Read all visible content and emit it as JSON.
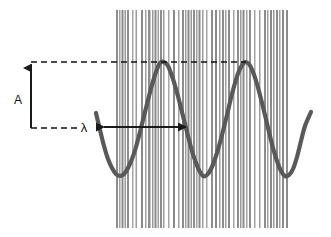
{
  "figure": {
    "background_color": "#ffffff",
    "width": 331,
    "height": 237
  },
  "labels": {
    "amplitude": "A",
    "wavelength": "λ"
  },
  "annotations": {
    "amplitude_arrow": {
      "name": "amplitude-arrow",
      "orientation": "vertical",
      "x": 31,
      "y_bottom": 128,
      "y_top": 62,
      "arrowhead": "top",
      "color": "#1a1a1a"
    },
    "wavelength_arrow": {
      "name": "wavelength-arrow",
      "orientation": "horizontal",
      "y": 127,
      "x_left": 101,
      "x_right": 189,
      "arrowhead": "both",
      "color": "#1a1a1a"
    },
    "dashed_line_crest": {
      "name": "crest-guide-line",
      "y": 62,
      "x_start": 31,
      "x_end": 246,
      "color": "#111111"
    },
    "dashed_line_midline": {
      "name": "midline-guide-line",
      "y": 128,
      "x_start": 31,
      "x_end": 78,
      "color": "#111111"
    }
  },
  "chart_data": {
    "type": "line",
    "title": "",
    "subtitle": "",
    "xlabel": "",
    "ylabel": "",
    "grid": false,
    "legend": null,
    "axis_ranges": {
      "x": [
        96,
        311
      ],
      "y": [
        62,
        177
      ]
    },
    "annotations": [
      {
        "text": "A",
        "meaning": "amplitude",
        "x": 18,
        "y": 100
      },
      {
        "text": "λ",
        "meaning": "wavelength",
        "x": 84,
        "y": 128
      }
    ],
    "series": [
      {
        "name": "wave",
        "color": "#595959",
        "line_width": 4.2,
        "wave_params": {
          "amplitude_px": 57,
          "midline_y": 119,
          "crest_y": 62,
          "trough_y": 176,
          "wavelength_px": 88,
          "x_start": 96,
          "x_end": 311,
          "first_trough_x": 120,
          "first_crest_x": 160,
          "second_trough_x": 203,
          "second_crest_x": 245,
          "third_trough_x": 287
        },
        "points": [
          [
            96,
            113
          ],
          [
            100,
            130
          ],
          [
            104,
            146
          ],
          [
            108,
            159
          ],
          [
            112,
            168
          ],
          [
            116,
            174
          ],
          [
            120,
            176
          ],
          [
            124,
            174
          ],
          [
            128,
            168
          ],
          [
            132,
            159
          ],
          [
            136,
            147
          ],
          [
            140,
            132
          ],
          [
            144,
            116
          ],
          [
            148,
            100
          ],
          [
            152,
            85
          ],
          [
            156,
            72
          ],
          [
            160,
            63
          ],
          [
            164,
            62
          ],
          [
            168,
            66
          ],
          [
            172,
            76
          ],
          [
            176,
            89
          ],
          [
            180,
            104
          ],
          [
            184,
            120
          ],
          [
            188,
            136
          ],
          [
            192,
            151
          ],
          [
            196,
            163
          ],
          [
            200,
            172
          ],
          [
            203,
            176
          ],
          [
            207,
            175
          ],
          [
            211,
            169
          ],
          [
            215,
            159
          ],
          [
            219,
            146
          ],
          [
            223,
            131
          ],
          [
            227,
            115
          ],
          [
            231,
            98
          ],
          [
            235,
            83
          ],
          [
            239,
            71
          ],
          [
            243,
            64
          ],
          [
            245,
            62
          ],
          [
            249,
            64
          ],
          [
            253,
            72
          ],
          [
            257,
            84
          ],
          [
            261,
            99
          ],
          [
            265,
            115
          ],
          [
            269,
            132
          ],
          [
            273,
            148
          ],
          [
            277,
            161
          ],
          [
            281,
            171
          ],
          [
            285,
            176
          ],
          [
            289,
            175
          ],
          [
            293,
            169
          ],
          [
            297,
            157
          ],
          [
            301,
            141
          ],
          [
            305,
            126
          ],
          [
            311,
            112
          ]
        ]
      }
    ]
  },
  "barcode": {
    "name": "barcode-background",
    "x": 116,
    "y": 10,
    "width": 174,
    "height": 218,
    "bar_color_dark": "#8a8a8a",
    "bar_color_light": "#b4b4b4",
    "bars": [
      {
        "x": 0,
        "w": 2,
        "c": "#8d8d8d"
      },
      {
        "x": 3,
        "w": 1.5,
        "c": "#a0a0a0"
      },
      {
        "x": 5.5,
        "w": 2,
        "c": "#8a8a8a"
      },
      {
        "x": 8.5,
        "w": 1.5,
        "c": "#9a9a9a"
      },
      {
        "x": 11,
        "w": 2,
        "c": "#8d8d8d"
      },
      {
        "x": 16,
        "w": 1.5,
        "c": "#a5a5a5"
      },
      {
        "x": 19.5,
        "w": 1.5,
        "c": "#9a9a9a"
      },
      {
        "x": 25,
        "w": 2,
        "c": "#8a8a8a"
      },
      {
        "x": 29,
        "w": 1.5,
        "c": "#a0a0a0"
      },
      {
        "x": 32,
        "w": 2.5,
        "c": "#8d8d8d"
      },
      {
        "x": 36,
        "w": 1.5,
        "c": "#999999"
      },
      {
        "x": 38.5,
        "w": 2,
        "c": "#8a8a8a"
      },
      {
        "x": 41.5,
        "w": 1.5,
        "c": "#a2a2a2"
      },
      {
        "x": 44,
        "w": 2,
        "c": "#8d8d8d"
      },
      {
        "x": 47,
        "w": 1.5,
        "c": "#9c9c9c"
      },
      {
        "x": 52,
        "w": 1.5,
        "c": "#a5a5a5"
      },
      {
        "x": 57,
        "w": 2,
        "c": "#8a8a8a"
      },
      {
        "x": 62,
        "w": 1.5,
        "c": "#9f9f9f"
      },
      {
        "x": 66,
        "w": 2,
        "c": "#8d8d8d"
      },
      {
        "x": 69,
        "w": 1.5,
        "c": "#a0a0a0"
      },
      {
        "x": 71.5,
        "w": 2,
        "c": "#8a8a8a"
      },
      {
        "x": 74.5,
        "w": 1.5,
        "c": "#9a9a9a"
      },
      {
        "x": 77,
        "w": 2,
        "c": "#8d8d8d"
      },
      {
        "x": 80,
        "w": 1.5,
        "c": "#a2a2a2"
      },
      {
        "x": 82.5,
        "w": 2,
        "c": "#8a8a8a"
      },
      {
        "x": 86,
        "w": 1.5,
        "c": "#9c9c9c"
      },
      {
        "x": 90,
        "w": 1.5,
        "c": "#a5a5a5"
      },
      {
        "x": 95,
        "w": 2,
        "c": "#8d8d8d"
      },
      {
        "x": 99,
        "w": 2,
        "c": "#8a8a8a"
      },
      {
        "x": 103,
        "w": 1.5,
        "c": "#9f9f9f"
      },
      {
        "x": 106,
        "w": 2,
        "c": "#8d8d8d"
      },
      {
        "x": 109,
        "w": 1.5,
        "c": "#a0a0a0"
      },
      {
        "x": 112,
        "w": 2,
        "c": "#8a8a8a"
      },
      {
        "x": 117,
        "w": 1.5,
        "c": "#a5a5a5"
      },
      {
        "x": 121,
        "w": 2,
        "c": "#8d8d8d"
      },
      {
        "x": 124,
        "w": 1.5,
        "c": "#9a9a9a"
      },
      {
        "x": 126.5,
        "w": 2,
        "c": "#8a8a8a"
      },
      {
        "x": 130,
        "w": 1.5,
        "c": "#a2a2a2"
      },
      {
        "x": 133,
        "w": 2,
        "c": "#8d8d8d"
      },
      {
        "x": 138,
        "w": 1.5,
        "c": "#a5a5a5"
      },
      {
        "x": 143,
        "w": 1.5,
        "c": "#9c9c9c"
      },
      {
        "x": 148,
        "w": 2,
        "c": "#8d8d8d"
      },
      {
        "x": 151,
        "w": 1.5,
        "c": "#a0a0a0"
      },
      {
        "x": 154,
        "w": 2,
        "c": "#8a8a8a"
      },
      {
        "x": 157,
        "w": 1.5,
        "c": "#9a9a9a"
      },
      {
        "x": 160,
        "w": 2,
        "c": "#8d8d8d"
      },
      {
        "x": 163,
        "w": 1.5,
        "c": "#a2a2a2"
      },
      {
        "x": 166,
        "w": 2,
        "c": "#8a8a8a"
      },
      {
        "x": 170,
        "w": 2,
        "c": "#8d8d8d"
      }
    ]
  }
}
